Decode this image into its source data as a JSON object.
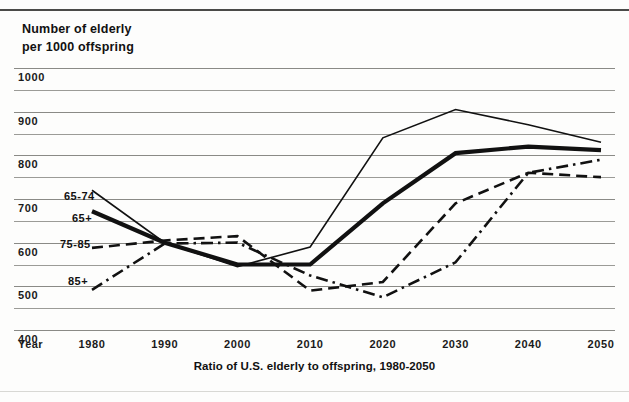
{
  "chart_data": {
    "type": "line",
    "title": "Ratio of U.S. elderly to offspring, 1980-2050",
    "ylabel_line1": "Number of elderly",
    "ylabel_line2": "per 1000 offspring",
    "xlabel": "Year",
    "x": [
      1980,
      1990,
      2000,
      2010,
      2020,
      2030,
      2040,
      2050
    ],
    "xticklabels": [
      "1980",
      "1990",
      "2000",
      "2010",
      "2020",
      "2030",
      "2040",
      "2050"
    ],
    "yticklabels": [
      "1000",
      "900",
      "800",
      "700",
      "600",
      "500",
      "400"
    ],
    "ytickvalues": [
      1000,
      900,
      800,
      700,
      600,
      500,
      400
    ],
    "ylim": [
      400,
      1000
    ],
    "xlim": [
      1980,
      2050
    ],
    "gridlines": [
      1000,
      950,
      900,
      850,
      800,
      750,
      700,
      650,
      600,
      550,
      500,
      450,
      400
    ],
    "grid": true,
    "legend_position": "inline-left",
    "series": [
      {
        "name": "65-74",
        "style": "solid-thin",
        "label": "65-74",
        "label_x": 64,
        "label_y": 190,
        "values": [
          720,
          600,
          545,
          590,
          840,
          905,
          870,
          830
        ]
      },
      {
        "name": "65+",
        "style": "solid-thick",
        "label": "65+",
        "label_x": 72,
        "label_y": 212,
        "values": [
          672,
          600,
          550,
          550,
          690,
          805,
          820,
          812
        ]
      },
      {
        "name": "75-85",
        "style": "dashed",
        "label": "75-85",
        "label_x": 60,
        "label_y": 238,
        "values": [
          588,
          605,
          615,
          490,
          510,
          690,
          760,
          750
        ]
      },
      {
        "name": "85+",
        "style": "dash-dot",
        "label": "85+",
        "label_x": 68,
        "label_y": 275,
        "values": [
          492,
          598,
          600,
          525,
          475,
          555,
          760,
          790
        ]
      }
    ]
  },
  "colors": {
    "ink": "#111111",
    "grid": "#9b9b97",
    "background": "#fdfdfc",
    "frame": "#4a4a48"
  }
}
